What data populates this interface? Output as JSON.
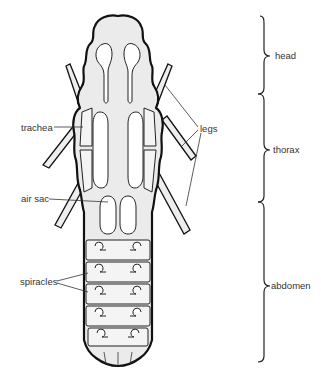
{
  "diagram": {
    "labels": {
      "trachea": "trachea",
      "air_sac": "air sac",
      "spiracles": "spiracles",
      "legs": "legs"
    },
    "regions": {
      "head": "head",
      "thorax": "thorax",
      "abdomen": "abdomen"
    },
    "colors": {
      "ink": "#111111",
      "stipple": "#ebebeb",
      "background": "#ffffff",
      "label_text": "#333333"
    }
  }
}
